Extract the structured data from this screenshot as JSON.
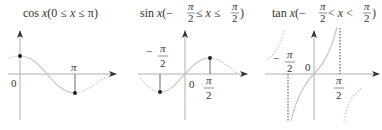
{
  "panels": [
    {
      "id": "cos",
      "title": {
        "func": "cos",
        "var": "x",
        "open": "(0 ≤ ",
        "var2": "x",
        "close": " ≤ π)"
      },
      "labels": {
        "origin": "0",
        "tick_x": "π"
      },
      "domain": "0 ≤ x ≤ π",
      "endpoints": [
        [
          0,
          1
        ],
        [
          3.1416,
          -1
        ]
      ]
    },
    {
      "id": "sin",
      "title": {
        "func": "sin",
        "var": "x",
        "open": "(−",
        "pi_num": "π",
        "pi_den": "2",
        "le1": " ≤ ",
        "var2": "x",
        "le2": " ≤ ",
        "pi_num2": "π",
        "pi_den2": "2",
        "close": ")"
      },
      "labels": {
        "origin": "0",
        "neg_num": "π",
        "neg_sign": "−",
        "neg_den": "2",
        "pos_num": "π",
        "pos_den": "2"
      },
      "domain": "−π/2 ≤ x ≤ π/2",
      "endpoints": [
        [
          -1.5708,
          -1
        ],
        [
          1.5708,
          1
        ]
      ]
    },
    {
      "id": "tan",
      "title": {
        "func": "tan",
        "var": "x",
        "open": "(−",
        "pi_num": "π",
        "pi_den": "2",
        "le1": " < ",
        "var2": "x",
        "le2": " < ",
        "pi_num2": "π",
        "pi_den2": "2",
        "close": ")"
      },
      "labels": {
        "origin": "0",
        "neg_num": "π",
        "neg_sign": "−",
        "neg_den": "2",
        "pos_num": "π",
        "pos_den": "2"
      },
      "domain": "−π/2 < x < π/2",
      "asymptotes": [
        -1.5708,
        1.5708
      ]
    }
  ]
}
